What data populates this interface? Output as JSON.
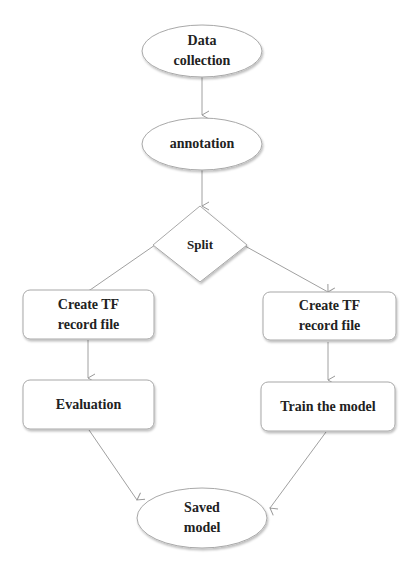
{
  "diagram": {
    "type": "flowchart",
    "nodes": {
      "data_collection": {
        "shape": "ellipse",
        "line1": "Data",
        "line2": "collection"
      },
      "annotation": {
        "shape": "ellipse",
        "label": "annotation"
      },
      "split": {
        "shape": "diamond",
        "label": "Split"
      },
      "tf_left": {
        "shape": "rounded-rect",
        "line1": "Create TF",
        "line2": "record file"
      },
      "tf_right": {
        "shape": "rounded-rect",
        "line1": "Create TF",
        "line2": "record file"
      },
      "evaluation": {
        "shape": "rounded-rect",
        "label": "Evaluation"
      },
      "train": {
        "shape": "rounded-rect",
        "label": "Train the model"
      },
      "saved_model": {
        "shape": "ellipse",
        "line1": "Saved",
        "line2": "model"
      }
    },
    "edges": [
      [
        "data_collection",
        "annotation"
      ],
      [
        "annotation",
        "split"
      ],
      [
        "split",
        "tf_left"
      ],
      [
        "split",
        "tf_right"
      ],
      [
        "tf_left",
        "evaluation"
      ],
      [
        "tf_right",
        "train"
      ],
      [
        "evaluation",
        "saved_model"
      ],
      [
        "train",
        "saved_model"
      ]
    ],
    "colors": {
      "stroke": "#9a9a9a",
      "fill": "#ffffff",
      "text": "#222222"
    }
  }
}
